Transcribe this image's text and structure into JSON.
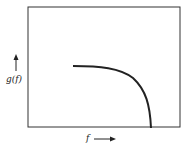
{
  "figure": {
    "ylabel": "g(f)",
    "xlabel": "f",
    "y_arrow": "up-arrow",
    "x_arrow": "right-arrow",
    "stroke": "#222222"
  }
}
